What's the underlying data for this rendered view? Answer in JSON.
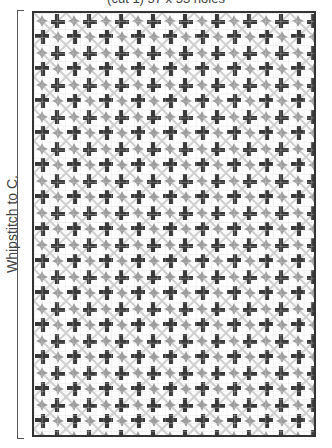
{
  "title": "(cut 1) 37 x 53 holes",
  "side_label": "Whipstitch to C.",
  "grid": {
    "columns": 37,
    "rows": 53,
    "colors": {
      "dark_cross": "#3a3a3a",
      "gray_star": "#9a9a9a",
      "light_diagonal": "#c8c8c8",
      "grid_line": "#d0d0d0",
      "border": "#333333"
    }
  }
}
